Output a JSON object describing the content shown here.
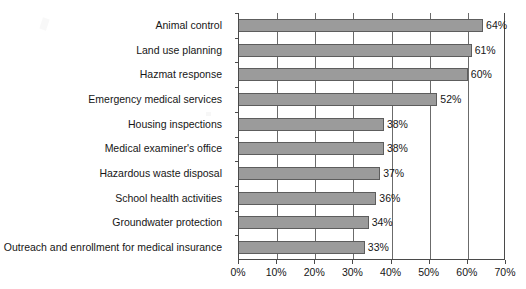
{
  "chart_data": {
    "type": "bar",
    "orientation": "horizontal",
    "title": "",
    "xlabel": "",
    "ylabel": "",
    "xlim": [
      0,
      70
    ],
    "grid": true,
    "legend": null,
    "categories": [
      "Animal control",
      "Land use planning",
      "Hazmat response",
      "Emergency medical services",
      "Housing inspections",
      "Medical examiner's office",
      "Hazardous waste disposal",
      "School health activities",
      "Groundwater protection",
      "Outreach and enrollment for medical insurance"
    ],
    "values": [
      64,
      61,
      60,
      52,
      38,
      38,
      37,
      36,
      34,
      33
    ],
    "value_labels": [
      "64%",
      "61%",
      "60%",
      "52%",
      "38%",
      "38%",
      "37%",
      "36%",
      "34%",
      "33%"
    ],
    "xticks": [
      0,
      10,
      20,
      30,
      40,
      50,
      60,
      70
    ],
    "xtick_labels": [
      "0%",
      "10%",
      "20%",
      "30%",
      "40%",
      "50%",
      "60%",
      "70%"
    ],
    "colors": {
      "bar_fill": "#9b9b9b",
      "bar_edge": "#5d5d5d",
      "gridline": "#6b6b6b",
      "axis": "#4a4a4a",
      "text": "#161616",
      "background": "#ffffff"
    }
  }
}
